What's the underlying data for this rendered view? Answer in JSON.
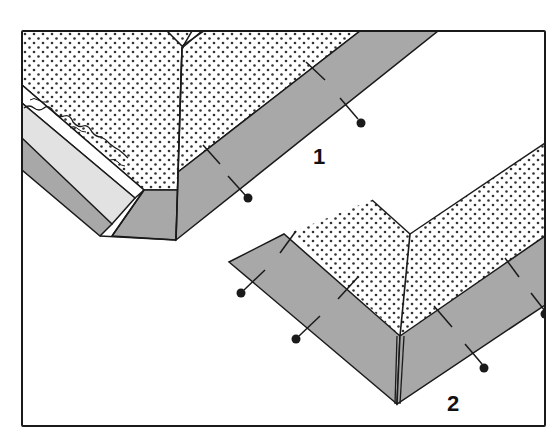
{
  "figure": {
    "labels": [
      "1",
      "2"
    ],
    "colors": {
      "background": "#ffffff",
      "outline": "#1a1a1a",
      "dotted_fabric": "#ffffff",
      "dots": "#333333",
      "gray_binding": "#a8a8a8",
      "light_gray_facing": "#e2e2e2"
    }
  },
  "diagram": {
    "panel_1": {
      "label": "1",
      "description": "mitered corner with lace edging, binding strip with pins"
    },
    "panel_2": {
      "label": "2",
      "description": "mitered binding corner with pins"
    }
  }
}
